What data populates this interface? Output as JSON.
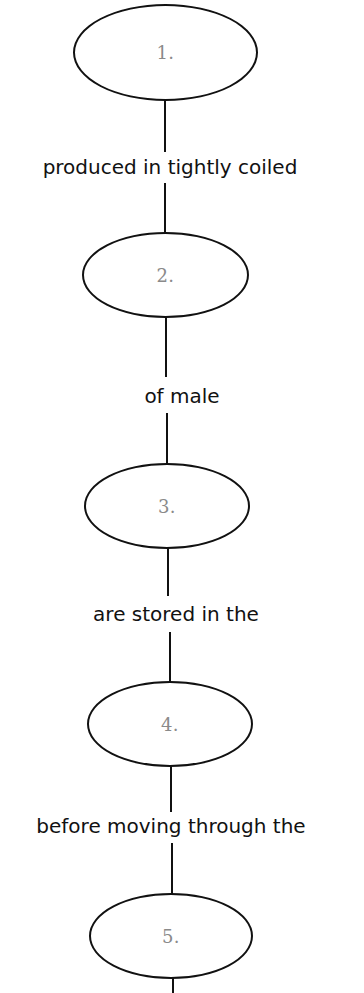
{
  "diagram": {
    "type": "vertical-concept-map",
    "colors": {
      "stroke": "#111111",
      "node_text": "#8a8a8a",
      "edge_text": "#111111",
      "background": "#ffffff"
    },
    "nodes": [
      {
        "label": "1."
      },
      {
        "label": "2."
      },
      {
        "label": "3."
      },
      {
        "label": "4."
      },
      {
        "label": "5."
      }
    ],
    "edges": [
      {
        "from": "1.",
        "to": "2.",
        "label": "produced in tightly coiled"
      },
      {
        "from": "2.",
        "to": "3.",
        "label": "of male"
      },
      {
        "from": "3.",
        "to": "4.",
        "label": "are stored in the"
      },
      {
        "from": "4.",
        "to": "5.",
        "label": "before moving through the"
      }
    ]
  }
}
